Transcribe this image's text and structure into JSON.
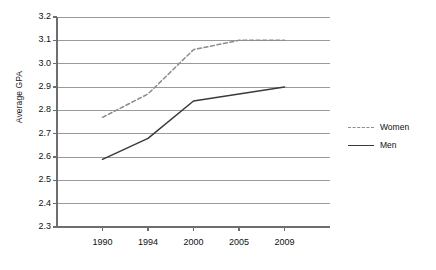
{
  "chart_data": {
    "type": "line",
    "title": "",
    "xlabel": "",
    "ylabel": "Average GPA",
    "categories": [
      "1990",
      "1994",
      "2000",
      "2005",
      "2009"
    ],
    "ylim": [
      2.3,
      3.2
    ],
    "yticks": [
      "3.2",
      "3.1",
      "3.0",
      "2.9",
      "2.8",
      "2.7",
      "2.6",
      "2.5",
      "2.4",
      "2.3"
    ],
    "ytick_values": [
      3.2,
      3.1,
      3.0,
      2.9,
      2.8,
      2.7,
      2.6,
      2.5,
      2.4,
      2.3
    ],
    "grid": "horizontal",
    "legend_position": "right",
    "series": [
      {
        "name": "Women",
        "style": "dashed",
        "color": "#8c8c8c",
        "values": [
          2.77,
          2.87,
          3.06,
          3.1,
          3.1
        ]
      },
      {
        "name": "Men",
        "style": "solid",
        "color": "#3a3a3a",
        "values": [
          2.59,
          2.68,
          2.84,
          2.87,
          2.9
        ]
      }
    ]
  },
  "axis": {
    "y_title": "Average GPA"
  },
  "legend": {
    "items": [
      {
        "label": "Women"
      },
      {
        "label": "Men"
      }
    ]
  },
  "colors": {
    "women_line": "#8c8c8c",
    "men_line": "#3a3a3a",
    "gridline": "#9a9a9a",
    "axis": "#6e6e6e",
    "text": "#111111"
  }
}
